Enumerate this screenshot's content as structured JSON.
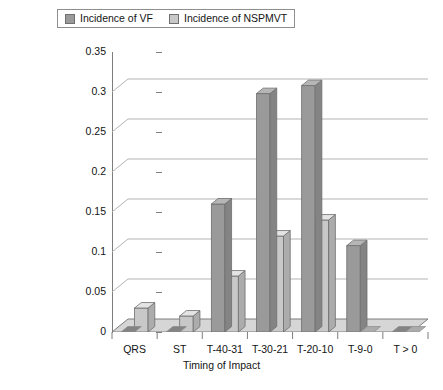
{
  "chart_data": {
    "type": "bar",
    "title": "",
    "subtitle": "",
    "xlabel": "Timing of Impact",
    "ylabel": "",
    "categories": [
      "QRS",
      "ST",
      "T-40-31",
      "T-30-21",
      "T-20-10",
      "T-9-0",
      "T > 0"
    ],
    "series": [
      {
        "name": "Incidence of VF",
        "color": "#9a9a9a",
        "values": [
          0.0,
          0.0,
          0.16,
          0.298,
          0.308,
          0.108,
          0.0
        ]
      },
      {
        "name": "Incidence of NSPMVT",
        "color": "#c8c8c8",
        "values": [
          0.03,
          0.02,
          0.07,
          0.12,
          0.14,
          0.0,
          0.0
        ]
      }
    ],
    "ylim": [
      0,
      0.35
    ],
    "yticks": [
      "0",
      "0.05",
      "0.1",
      "0.15",
      "0.2",
      "0.25",
      "0.3",
      "0.35"
    ],
    "ytick_values": [
      0,
      0.05,
      0.1,
      0.15,
      0.2,
      0.25,
      0.3,
      0.35
    ],
    "grid": true,
    "legend_position": "top",
    "style_3d": true
  },
  "legend": {
    "entries": [
      {
        "label": "Incidence of VF",
        "color": "#9a9a9a"
      },
      {
        "label": "Incidence of NSPMVT",
        "color": "#c8c8c8"
      }
    ]
  },
  "axes": {
    "x_title": "Timing of Impact"
  },
  "colors": {
    "series_vf": "#9a9a9a",
    "series_nspmvt": "#c8c8c8",
    "gridline": "#b4b4b4",
    "axis": "#7d7d7d",
    "floor": "#d6d6d6",
    "text": "#141414"
  }
}
